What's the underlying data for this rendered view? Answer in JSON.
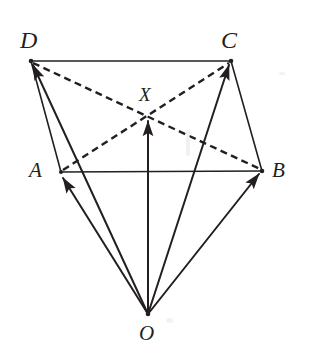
{
  "figure": {
    "kind": "vector-geometry-diagram",
    "background_color": "#ffffff",
    "ink_color": "#231f20",
    "width": 315,
    "height": 359,
    "labels": {
      "D": "D",
      "C": "C",
      "X": "X",
      "A": "A",
      "B": "B",
      "O": "O"
    },
    "points": {
      "D": {
        "x": 31,
        "y": 61,
        "label": "D"
      },
      "C": {
        "x": 231,
        "y": 61,
        "label": "C"
      },
      "A": {
        "x": 61,
        "y": 172,
        "label": "A"
      },
      "B": {
        "x": 262,
        "y": 171,
        "label": "B"
      },
      "X": {
        "x": 148,
        "y": 116,
        "label": "X"
      },
      "O": {
        "x": 148,
        "y": 314,
        "label": "O"
      }
    },
    "solid_edges": [
      {
        "name": "edge-DC",
        "from": "D",
        "to": "C"
      },
      {
        "name": "edge-DA",
        "from": "D",
        "to": "A"
      },
      {
        "name": "edge-AB",
        "from": "A",
        "to": "B"
      },
      {
        "name": "edge-CB",
        "from": "C",
        "to": "B"
      }
    ],
    "dashed_diagonals": [
      {
        "name": "diagonal-DB",
        "from": "D",
        "to": "B"
      },
      {
        "name": "diagonal-AC",
        "from": "A",
        "to": "C"
      }
    ],
    "vectors_from_origin": [
      {
        "name": "vector-OD",
        "from": "O",
        "to": "D",
        "arrow": true
      },
      {
        "name": "vector-OA",
        "from": "O",
        "to": "A",
        "arrow": true
      },
      {
        "name": "vector-OX",
        "from": "O",
        "to": "X",
        "arrow": true
      },
      {
        "name": "vector-OC",
        "from": "O",
        "to": "C",
        "arrow": true
      },
      {
        "name": "vector-OB",
        "from": "O",
        "to": "B",
        "arrow": true
      }
    ],
    "style": {
      "solid_stroke_width": 1.6,
      "vector_stroke_width": 2.0,
      "dash_pattern": "7,4.5",
      "dash_stroke_width": 2.4
    }
  }
}
